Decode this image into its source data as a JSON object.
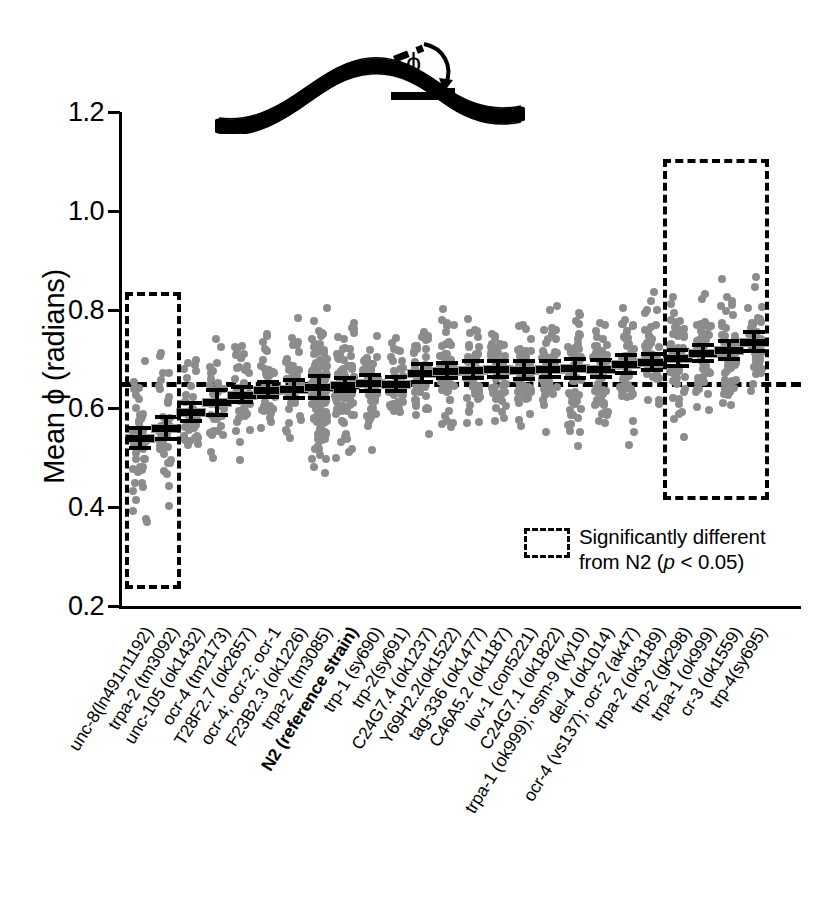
{
  "axes": {
    "y_title": "Mean ϕ (radians)",
    "y_ticks": [
      "1.2",
      "1.0",
      "0.8",
      "0.6",
      "0.4",
      "0.2"
    ],
    "y_tick_values": [
      1.2,
      1.0,
      0.8,
      0.6,
      0.4,
      0.2
    ],
    "ylim": [
      0.2,
      1.2
    ]
  },
  "legend": {
    "line1": "Significantly different",
    "line2_pre": "from N2 (",
    "line2_italic": "p",
    "line2_post": " < 0.05)"
  },
  "diagram": {
    "angle_symbol": "ϕ",
    "icon": "worm-phi-diagram"
  },
  "chart_data": {
    "type": "scatter",
    "title": "",
    "xlabel": "",
    "ylabel": "Mean ϕ (radians)",
    "ylim": [
      0.2,
      1.2
    ],
    "grid": false,
    "reference_line": {
      "value": 0.65,
      "label": "N2 reference",
      "style": "dashed"
    },
    "categories": [
      "unc-8(ln491n1192)",
      "trpa-2 (tm3092)",
      "unc-105 (ok1432)",
      "ocr-4 (tm2173)",
      "T28F2.7 (ok2657)",
      "ocr-4; ocr-2; ocr-1",
      "F23B2.3 (ok1226)",
      "trpa-2 (tm3085)",
      "N2 (reference strain)",
      "trp-1 (sy690)",
      "trp-2(sy691)",
      "C24G7.4 (ok1237)",
      "Y69H2.2(ok1522)",
      "tag-336 (ok1477)",
      "C46A5.2 (ok1187)",
      "lov-1 (con5221)",
      "C24G7.1 (ok1822)",
      "trpa-1 (ok999); osm-9 (ky10)",
      "del-4 (ok1014)",
      "ocr-4 (vs137); ocr-2 (ak47)",
      "trpa-2 (ok3189)",
      "trp-2 (gk298)",
      "trpa-1 (ok999)",
      "cr-3 (ok1559)",
      "trp-4(sy695)"
    ],
    "bold_categories": [
      "N2 (reference strain)"
    ],
    "means": [
      0.54,
      0.56,
      0.592,
      0.612,
      0.628,
      0.638,
      0.64,
      0.643,
      0.648,
      0.652,
      0.65,
      0.672,
      0.676,
      0.678,
      0.679,
      0.678,
      0.68,
      0.681,
      0.68,
      0.69,
      0.694,
      0.702,
      0.712,
      0.718,
      0.735
    ],
    "sem": [
      0.02,
      0.022,
      0.018,
      0.026,
      0.016,
      0.015,
      0.018,
      0.022,
      0.013,
      0.016,
      0.014,
      0.018,
      0.015,
      0.017,
      0.016,
      0.018,
      0.016,
      0.019,
      0.017,
      0.018,
      0.016,
      0.017,
      0.016,
      0.018,
      0.019
    ],
    "significant_groups": [
      {
        "name": "lower-than-N2",
        "from_index": 0,
        "to_index": 1,
        "ymin": 0.235,
        "ymax": 0.835
      },
      {
        "name": "higher-than-N2",
        "from_index": 21,
        "to_index": 24,
        "ymin": 0.415,
        "ymax": 1.105
      }
    ],
    "point_counts": [
      46,
      40,
      34,
      36,
      38,
      36,
      40,
      118,
      78,
      44,
      36,
      46,
      46,
      46,
      50,
      44,
      46,
      44,
      48,
      48,
      46,
      50,
      52,
      50,
      46
    ],
    "point_spread": [
      0.115,
      0.11,
      0.085,
      0.09,
      0.085,
      0.085,
      0.09,
      0.11,
      0.095,
      0.092,
      0.08,
      0.095,
      0.09,
      0.09,
      0.092,
      0.095,
      0.09,
      0.098,
      0.092,
      0.098,
      0.095,
      0.1,
      0.098,
      0.1,
      0.098
    ],
    "point_color": "#8c8c8c",
    "marker_color": "#000000"
  }
}
